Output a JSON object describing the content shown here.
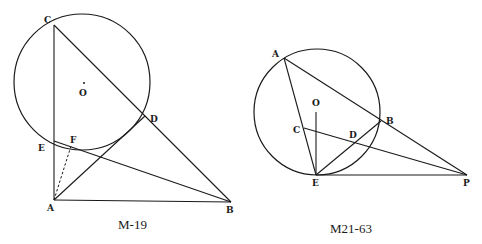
{
  "figures": [
    {
      "caption": "M-19",
      "circle": {
        "center_label": "O",
        "cx": 82,
        "cy": 82,
        "r": 68
      },
      "points": {
        "A": {
          "label": "A",
          "x": 54,
          "y": 200
        },
        "B": {
          "label": "B",
          "x": 231,
          "y": 202
        },
        "C": {
          "label": "C",
          "x": 54,
          "y": 25
        },
        "D": {
          "label": "D",
          "x": 145,
          "y": 116
        },
        "E": {
          "label": "E",
          "x": 54,
          "y": 141
        },
        "F": {
          "label": "F",
          "x": 71,
          "y": 146
        },
        "O": {
          "label": "O",
          "x": 84,
          "y": 83
        }
      },
      "segments": [
        "C-A",
        "A-B",
        "C-B",
        "E-B",
        "A-D"
      ],
      "dashed_segments": [
        "A-F"
      ]
    },
    {
      "caption": "M21-63",
      "circle": {
        "cx": 317,
        "cy": 112,
        "r": 63
      },
      "points": {
        "A": {
          "label": "A",
          "x": 284,
          "y": 58
        },
        "B": {
          "label": "B",
          "x": 381,
          "y": 121
        },
        "C": {
          "label": "C",
          "x": 304,
          "y": 128
        },
        "D": {
          "label": "D",
          "x": 353,
          "y": 140
        },
        "E": {
          "label": "E",
          "x": 316,
          "y": 175
        },
        "O": {
          "label": "O",
          "x": 316,
          "y": 103
        },
        "P": {
          "label": "P",
          "x": 467,
          "y": 175
        }
      },
      "segments": [
        "A-E",
        "A-P",
        "E-P",
        "C-P",
        "E-B",
        "O-E"
      ]
    }
  ]
}
